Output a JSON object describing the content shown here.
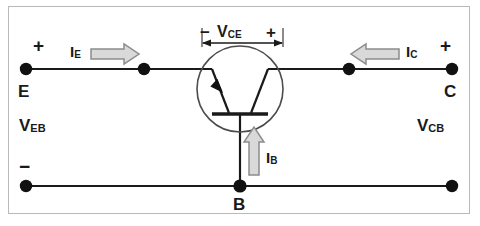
{
  "diagram": {
    "background_color": "#ffffff",
    "frame_color": "#b9b9b9",
    "wire_color": "#1a1a1a",
    "node_color": "#111111",
    "arrow_fill": "#d9d9d9",
    "arrow_stroke": "#8c8c8c"
  },
  "terminals": {
    "emitter": {
      "letter": "E",
      "sign": "+",
      "name": "emitter-terminal"
    },
    "collector": {
      "letter": "C",
      "sign": "+",
      "name": "collector-terminal"
    },
    "base": {
      "letter": "B",
      "name": "base-terminal"
    },
    "emitter_return": {
      "sign": "−",
      "name": "emitter-return-terminal"
    },
    "collector_return": {
      "sign": "",
      "name": "collector-return-terminal"
    }
  },
  "voltages": [
    {
      "id": "veb",
      "symbol": "V",
      "subscript": "EB"
    },
    {
      "id": "vcb",
      "symbol": "V",
      "subscript": "CB"
    },
    {
      "id": "vce",
      "symbol": "V",
      "subscript": "CE",
      "left_sign": "−",
      "right_sign": "+"
    }
  ],
  "currents": [
    {
      "id": "ie",
      "symbol": "I",
      "subscript": "E",
      "direction": "right"
    },
    {
      "id": "ic",
      "symbol": "I",
      "subscript": "C",
      "direction": "left"
    },
    {
      "id": "ib",
      "symbol": "I",
      "subscript": "B",
      "direction": "up"
    }
  ],
  "device": {
    "type": "PNP bipolar junction transistor",
    "emitter_side": "left",
    "collector_side": "right",
    "base_side": "bottom",
    "arrow_on": "emitter",
    "arrow_points": "into-base"
  }
}
